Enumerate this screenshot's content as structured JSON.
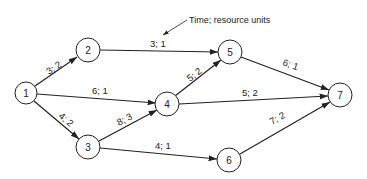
{
  "diagram": {
    "type": "activity-on-arrow network",
    "annotation": {
      "label": "Time; resource units",
      "points_to_edge": "2-5"
    },
    "nodes": [
      {
        "id": "1",
        "label": "1",
        "x": 26,
        "y": 93
      },
      {
        "id": "2",
        "label": "2",
        "x": 88,
        "y": 50
      },
      {
        "id": "3",
        "label": "3",
        "x": 88,
        "y": 147
      },
      {
        "id": "4",
        "label": "4",
        "x": 167,
        "y": 104
      },
      {
        "id": "5",
        "label": "5",
        "x": 230,
        "y": 52
      },
      {
        "id": "6",
        "label": "6",
        "x": 229,
        "y": 160
      },
      {
        "id": "7",
        "label": "7",
        "x": 340,
        "y": 95
      }
    ],
    "edges": [
      {
        "from": "1",
        "to": "2",
        "label": "3; 2"
      },
      {
        "from": "1",
        "to": "4",
        "label": "6; 1"
      },
      {
        "from": "1",
        "to": "3",
        "label": "4; 2"
      },
      {
        "from": "2",
        "to": "5",
        "label": "3; 1"
      },
      {
        "from": "3",
        "to": "4",
        "label": "8; 3"
      },
      {
        "from": "3",
        "to": "6",
        "label": "4; 1"
      },
      {
        "from": "4",
        "to": "5",
        "label": "5; 2"
      },
      {
        "from": "4",
        "to": "7",
        "label": "5; 2"
      },
      {
        "from": "5",
        "to": "7",
        "label": "6; 1"
      },
      {
        "from": "6",
        "to": "7",
        "label": "7; 2"
      }
    ]
  }
}
